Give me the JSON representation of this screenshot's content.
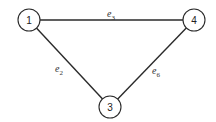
{
  "diagram": {
    "type": "graph",
    "nodes": [
      {
        "id": "1",
        "label": "1",
        "x": 29,
        "y": 20,
        "r": 11
      },
      {
        "id": "4",
        "label": "4",
        "x": 194,
        "y": 20,
        "r": 11
      },
      {
        "id": "3",
        "label": "3",
        "x": 110,
        "y": 107,
        "r": 11
      }
    ],
    "edges": [
      {
        "id": "e3",
        "from": "1",
        "to": "4",
        "label_base": "e",
        "label_sub": "3",
        "lx": 107,
        "ly": 17
      },
      {
        "id": "e2",
        "from": "1",
        "to": "3",
        "label_base": "e",
        "label_sub": "2",
        "lx": 55,
        "ly": 72
      },
      {
        "id": "e6",
        "from": "4",
        "to": "3",
        "label_base": "e",
        "label_sub": "6",
        "lx": 152,
        "ly": 74
      }
    ]
  }
}
